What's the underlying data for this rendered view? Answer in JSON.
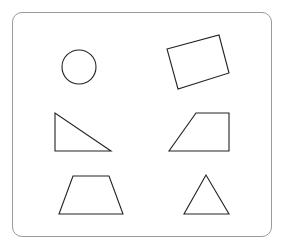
{
  "header": {
    "cut_text": ""
  },
  "figure": {
    "frame": {
      "stroke": "#9a9a9a"
    },
    "shapes": [
      {
        "name": "circle",
        "cx": 79,
        "cy": 67,
        "r": 17
      },
      {
        "name": "rotated-rectangle",
        "points": "167,49 219,35 229,73 178,89"
      },
      {
        "name": "right-triangle",
        "points": "55,113 55,151 111,151"
      },
      {
        "name": "right-trapezoid",
        "points": "196,113 229,113 229,151 169,151"
      },
      {
        "name": "isosceles-trapezoid",
        "points": "73,176 109,176 123,214 59,214"
      },
      {
        "name": "triangle",
        "points": "206,175 184,214 229,214"
      }
    ],
    "stroke_color": "#222222"
  }
}
